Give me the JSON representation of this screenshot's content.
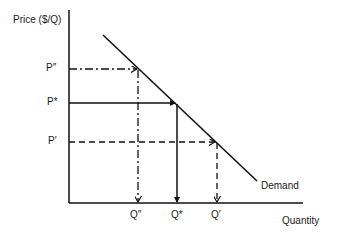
{
  "diagram": {
    "type": "supply-demand",
    "y_axis_label": "Price ($/Q)",
    "x_axis_label": "Quantity",
    "curve_label": "Demand",
    "price_levels": [
      {
        "label": "P″",
        "style": "dash-dot"
      },
      {
        "label": "P*",
        "style": "solid"
      },
      {
        "label": "P′",
        "style": "dashed"
      }
    ],
    "quantity_levels": [
      {
        "label": "Q″",
        "style": "dash-dot"
      },
      {
        "label": "Q*",
        "style": "solid"
      },
      {
        "label": "Q′",
        "style": "dashed"
      }
    ],
    "line_color": "#111111"
  }
}
